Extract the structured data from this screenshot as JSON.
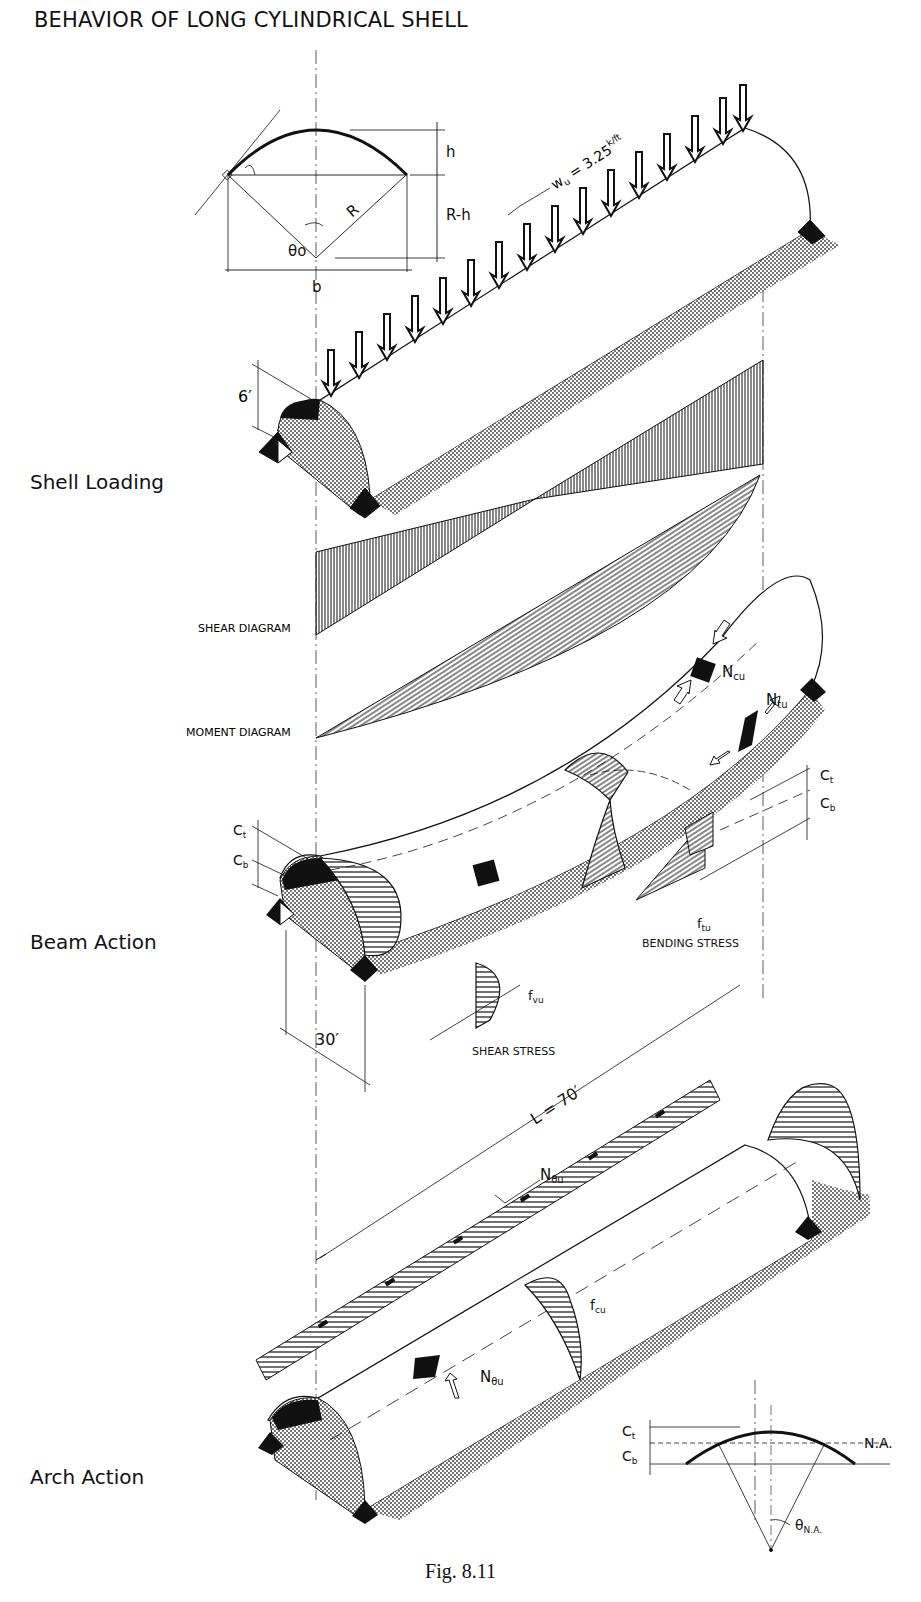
{
  "title": "BEHAVIOR OF LONG CYLINDRICAL SHELL",
  "caption": "Fig. 8.11",
  "sections": {
    "shell_loading": {
      "label": "Shell Loading"
    },
    "beam_action": {
      "label": "Beam Action"
    },
    "arch_action": {
      "label": "Arch Action"
    }
  },
  "cross_section": {
    "h": "h",
    "r_minus_h": "R-h",
    "R": "R",
    "theta": "θo",
    "b": "b"
  },
  "loading": {
    "wu_label": "wu = 3.25 k/ft",
    "wu_sym": "w",
    "wu_sub": "u",
    "wu_eq": " = 3.25",
    "wu_sup": "k/ft",
    "rise": "6′"
  },
  "diagrams": {
    "shear": "SHEAR DIAGRAM",
    "moment": "MOMENT DIAGRAM"
  },
  "beam": {
    "ncu": "N",
    "ncu_sub": "cu",
    "ntu": "N",
    "ntu_sub": "tu",
    "ct": "C",
    "ct_sub": "t",
    "cb": "C",
    "cb_sub": "b",
    "ftu": "f",
    "ftu_sub": "tu",
    "fvu": "f",
    "fvu_sub": "vu",
    "bending_stress": "BENDING STRESS",
    "shear_stress": "SHEAR STRESS",
    "width": "30′"
  },
  "arch": {
    "length": "L = 70′",
    "n_theta": "N",
    "n_theta_sub": "θu",
    "fcu": "f",
    "fcu_sub": "cu",
    "ct": "C",
    "ct_sub": "t",
    "cb": "C",
    "cb_sub": "b",
    "na": "N.A.",
    "theta_na": "θ",
    "theta_na_sub": "N.A."
  }
}
